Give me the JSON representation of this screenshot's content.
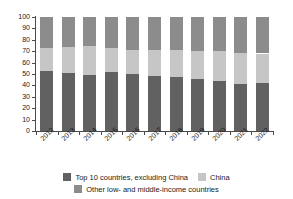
{
  "chart_data": {
    "type": "bar",
    "subtype": "stacked-percent",
    "title": "",
    "subtitle": "",
    "xlabel": "",
    "ylabel": "",
    "ylim": [
      0,
      100
    ],
    "yticks": [
      0,
      10,
      20,
      30,
      40,
      50,
      60,
      70,
      80,
      90,
      100
    ],
    "ytick_labels": [
      "0",
      "10",
      "20",
      "30",
      "40",
      "50",
      "60",
      "70",
      "80",
      "90",
      "100"
    ],
    "grid": false,
    "legend_position": "bottom",
    "categories": [
      "2012",
      "2013",
      "2014",
      "2015",
      "2016",
      "2017",
      "2018",
      "2019",
      "2020",
      "2021",
      "2022"
    ],
    "series": [
      {
        "name": "Top 10 countries, excluding China",
        "color": "#616161",
        "values": [
          52.5,
          51,
          49,
          51.5,
          50,
          48.5,
          47,
          46,
          43.5,
          41,
          42
        ]
      },
      {
        "name": "China",
        "color": "#c6c6c6",
        "values": [
          20.5,
          23,
          25.5,
          21.5,
          21,
          22.5,
          24,
          24.5,
          26.5,
          27.5,
          26
        ]
      },
      {
        "name": "Other low- and middle-income countries",
        "color": "#8c8c8c",
        "values": [
          27,
          26,
          25.5,
          27,
          29,
          29,
          29,
          29.5,
          30,
          31.5,
          32
        ]
      }
    ]
  },
  "axes": {
    "y_axis_name": "percent-share",
    "x_axis_name": "year"
  },
  "legend": {
    "items": [
      {
        "label": "Top 10 countries, excluding China",
        "color": "#616161"
      },
      {
        "label": "China",
        "color": "#c6c6c6"
      },
      {
        "label": "Other low- and middle-income countries",
        "color": "#8c8c8c"
      }
    ]
  }
}
